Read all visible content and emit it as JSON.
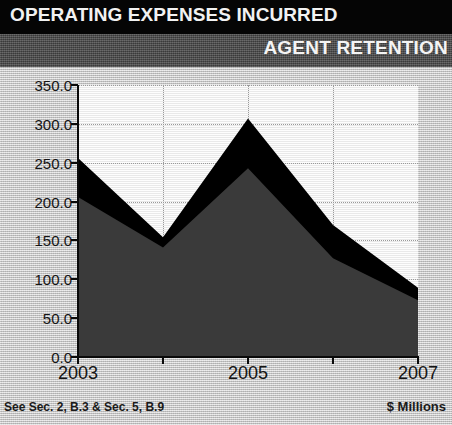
{
  "header": {
    "title": "OPERATING EXPENSES INCURRED",
    "subtitle": "AGENT RETENTION"
  },
  "footer": {
    "left": "See Sec. 2, B.3 & Sec. 5, B.9",
    "right": "$ Millions"
  },
  "colors": {
    "title_bar": "#050505",
    "subtitle_bar": "#4d4d4d",
    "page_background": "#c6c6c6",
    "plot_background": "#f7f7f7",
    "series_upper": "#000000",
    "series_lower": "#3a3a3a",
    "gridline": "#9a9a9a",
    "axis": "#0a0a0a"
  },
  "chart_data": {
    "type": "area",
    "title": "OPERATING EXPENSES INCURRED",
    "subtitle": "AGENT RETENTION",
    "xlabel": "",
    "ylabel": "$ Millions",
    "x": [
      2003,
      2004,
      2005,
      2006,
      2007
    ],
    "categories": [
      "2003",
      "2004",
      "2005",
      "2006",
      "2007"
    ],
    "xtick_labels": [
      "2003",
      "",
      "2005",
      "",
      "2007"
    ],
    "ytick_labels": [
      "0.0",
      "50.0",
      "100.0",
      "150.0",
      "200.0",
      "250.0",
      "300.0",
      "350.0"
    ],
    "ytick_values": [
      0,
      50,
      100,
      150,
      200,
      250,
      300,
      350
    ],
    "ylim": [
      0,
      350
    ],
    "xlim": [
      2003,
      2007
    ],
    "grid": true,
    "legend": false,
    "stacked": false,
    "series": [
      {
        "name": "Total operating expenses",
        "color": "#000000",
        "values": [
          256,
          154,
          307,
          170,
          89
        ]
      },
      {
        "name": "Agent retention expenses",
        "color": "#3a3a3a",
        "values": [
          206,
          141,
          243,
          127,
          73
        ]
      }
    ]
  }
}
